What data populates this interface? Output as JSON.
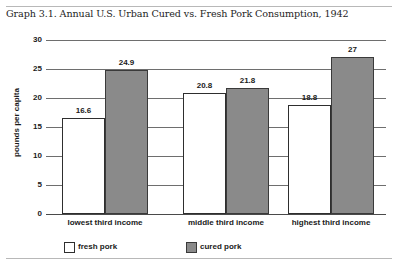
{
  "chart_data": {
    "type": "bar",
    "title": "Graph 3.1. Annual U.S. Urban Cured vs. Fresh Pork Consumption, 1942",
    "xlabel": "",
    "ylabel": "pounds per capita",
    "categories": [
      "lowest third income",
      "middle third income",
      "highest third income"
    ],
    "series": [
      {
        "name": "fresh pork",
        "values": [
          16.6,
          20.8,
          18.8
        ],
        "color": "#ffffff"
      },
      {
        "name": "cured pork",
        "values": [
          24.9,
          21.8,
          27
        ],
        "color": "#8a8a8a"
      }
    ],
    "value_labels": {
      "fresh": [
        "16.6",
        "20.8",
        "18.8"
      ],
      "cured": [
        "24.9",
        "21.8",
        "27"
      ]
    },
    "ylim": [
      0,
      30
    ],
    "yticks": [
      "0",
      "5",
      "10",
      "15",
      "20",
      "25",
      "30"
    ],
    "grid": true,
    "legend_position": "bottom"
  },
  "legend": {
    "items": [
      {
        "label": "fresh pork",
        "swatch": "fresh"
      },
      {
        "label": "cured pork",
        "swatch": "cured"
      }
    ]
  },
  "colors": {
    "cured_fill": "#8a8a8a",
    "fresh_fill": "#ffffff",
    "gridline": "#6e6e6e",
    "rule": "#b8b8b8"
  }
}
